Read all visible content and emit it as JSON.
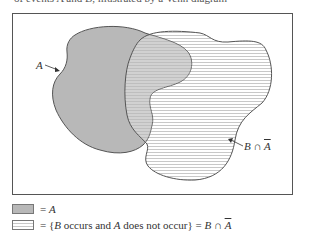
{
  "header_fragment": "of events A and B, illustrated by a Venn diagram",
  "diagram": {
    "label_a": "A",
    "label_b_not_a_prefix": "B ∩ ",
    "label_b_not_a_bar": "A",
    "colors": {
      "frame": "#555555",
      "region_a_fill": "#b8b8b8",
      "outline": "#555555",
      "hatch": "#c8c8c8"
    }
  },
  "legend": {
    "items": [
      {
        "swatch": "gray-fill",
        "text_prefix": "= ",
        "text_var": "A"
      },
      {
        "swatch": "horizontal-hatch",
        "text": "= {",
        "b": "B",
        "mid": " occurs and ",
        "a": "A",
        "tail": " does not occur} = ",
        "b2": "B",
        "cap": " ∩ ",
        "abar": "A"
      }
    ]
  }
}
